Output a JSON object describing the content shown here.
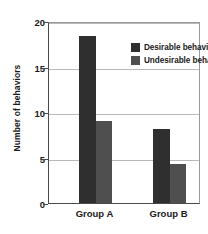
{
  "chart_data": {
    "type": "bar",
    "title": "",
    "xlabel": "",
    "ylabel": "Number of behaviors",
    "categories": [
      "Group A",
      "Group B"
    ],
    "series": [
      {
        "name": "Desirable behaviors",
        "values": [
          18.4,
          8.1
        ],
        "color": "#2f2f2f"
      },
      {
        "name": "Undesirable behaviors",
        "values": [
          9.0,
          4.3
        ],
        "color": "#4f4f4f"
      }
    ],
    "ylim": [
      0,
      20
    ],
    "yticks": [
      0,
      5,
      10,
      15,
      20
    ],
    "ytick_labels": [
      "0",
      "5",
      "10",
      "15",
      "20"
    ],
    "grid": true,
    "legend_position": "top-right-inside"
  }
}
